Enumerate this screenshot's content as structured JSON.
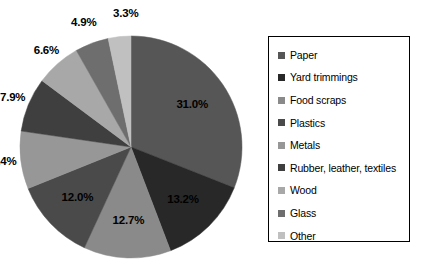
{
  "chart_data": {
    "type": "pie",
    "title": "",
    "subtitle": "",
    "xlabel": "",
    "ylabel": "",
    "legend_position": "right",
    "grid": false,
    "start_angle_clock": "12 o'clock",
    "direction": "clockwise",
    "units": "percent",
    "total": "100.0%",
    "categories": [
      "Paper",
      "Yard trimmings",
      "Food scraps",
      "Plastics",
      "Metals",
      "Rubber, leather, textiles",
      "Wood",
      "Glass",
      "Other"
    ],
    "values": [
      31.0,
      13.2,
      12.7,
      12.0,
      8.4,
      7.9,
      6.6,
      4.9,
      3.3
    ],
    "data_labels": [
      "31.0%",
      "13.2%",
      "12.7%",
      "12.0%",
      "8.4%",
      "7.9%",
      "6.6%",
      "4.9%",
      "3.3%"
    ],
    "colors": [
      "#565656",
      "#282828",
      "#8a8a8a",
      "#4a4a4a",
      "#979797",
      "#3f3f3f",
      "#a8a8a8",
      "#6e6e6e",
      "#c0c0c0"
    ],
    "slices": [
      {
        "label": "Paper",
        "value": 31.0,
        "data_label": "31.0%",
        "color": "#565656"
      },
      {
        "label": "Yard trimmings",
        "value": 13.2,
        "data_label": "13.2%",
        "color": "#282828"
      },
      {
        "label": "Food scraps",
        "value": 12.7,
        "data_label": "12.7%",
        "color": "#8a8a8a"
      },
      {
        "label": "Plastics",
        "value": 12.0,
        "data_label": "12.0%",
        "color": "#4a4a4a"
      },
      {
        "label": "Metals",
        "value": 8.4,
        "data_label": "8.4%",
        "color": "#979797"
      },
      {
        "label": "Rubber, leather, textiles",
        "value": 7.9,
        "data_label": "7.9%",
        "color": "#3f3f3f"
      },
      {
        "label": "Wood",
        "value": 6.6,
        "data_label": "6.6%",
        "color": "#a8a8a8"
      },
      {
        "label": "Glass",
        "value": 4.9,
        "data_label": "4.9%",
        "color": "#6e6e6e"
      },
      {
        "label": "Other",
        "value": 3.3,
        "data_label": "3.3%",
        "color": "#c0c0c0"
      }
    ]
  },
  "legend": {
    "border_color": "#000000",
    "items": [
      {
        "label": "Paper",
        "color": "#565656"
      },
      {
        "label": "Yard trimmings",
        "color": "#282828"
      },
      {
        "label": "Food scraps",
        "color": "#8a8a8a"
      },
      {
        "label": "Plastics",
        "color": "#4a4a4a"
      },
      {
        "label": "Metals",
        "color": "#979797"
      },
      {
        "label": "Rubber, leather, textiles",
        "color": "#3f3f3f"
      },
      {
        "label": "Wood",
        "color": "#a8a8a8"
      },
      {
        "label": "Glass",
        "color": "#6e6e6e"
      },
      {
        "label": "Other",
        "color": "#c0c0c0"
      }
    ]
  },
  "geometry": {
    "center_x": 131,
    "center_y": 147,
    "radius": 111,
    "label_radius_inside": 74,
    "label_radius_outside": 128
  }
}
